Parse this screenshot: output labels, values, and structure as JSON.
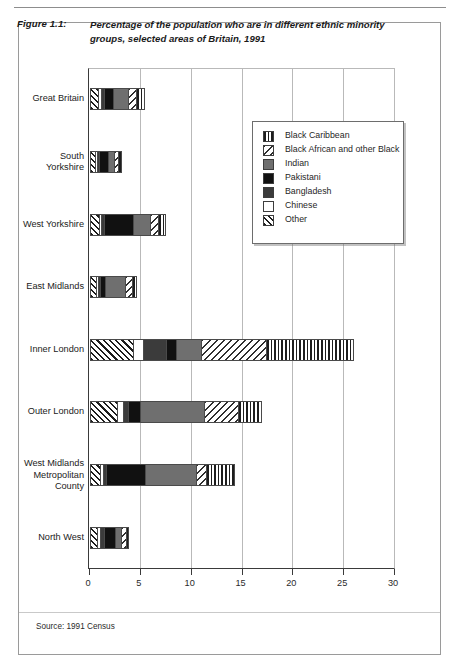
{
  "figure": {
    "label": "Figure 1.1:",
    "title": "Percentage of the population who are in different ethnic minority groups, selected areas of Britain, 1991",
    "source": "Source: 1991 Census"
  },
  "chart_data": {
    "type": "bar",
    "orientation": "horizontal",
    "stacked": true,
    "title": "Percentage of the population who are in different ethnic minority groups, selected areas of Britain, 1991",
    "xlabel": "",
    "ylabel": "",
    "xlim": [
      0,
      30
    ],
    "xticks": [
      0,
      5,
      10,
      15,
      20,
      25,
      30
    ],
    "grid": true,
    "legend_position": "upper-right-inside",
    "categories": [
      "Great Britain",
      "South Yorkshire",
      "West Yorkshire",
      "East Midlands",
      "Inner London",
      "Outer London",
      "West Midlands Metropolitan County",
      "North West"
    ],
    "series": [
      {
        "name": "Other",
        "pattern": "diagonal-hatch",
        "values": [
          0.8,
          0.5,
          0.9,
          0.6,
          4.3,
          2.7,
          1.0,
          0.7
        ]
      },
      {
        "name": "Chinese",
        "pattern": "white",
        "values": [
          0.3,
          0.2,
          0.2,
          0.2,
          1.0,
          0.6,
          0.3,
          0.3
        ]
      },
      {
        "name": "Bangladesh",
        "pattern": "dark-gray",
        "values": [
          0.3,
          0.2,
          0.3,
          0.2,
          2.2,
          0.5,
          0.3,
          0.4
        ]
      },
      {
        "name": "Pakistani",
        "pattern": "black",
        "values": [
          0.9,
          0.9,
          2.9,
          0.5,
          1.0,
          1.2,
          3.9,
          1.1
        ]
      },
      {
        "name": "Indian",
        "pattern": "medium-gray",
        "values": [
          1.5,
          0.6,
          1.6,
          2.0,
          2.5,
          6.3,
          5.0,
          0.6
        ]
      },
      {
        "name": "Black African and other Black",
        "pattern": "dotted",
        "values": [
          0.8,
          0.4,
          0.8,
          0.7,
          6.4,
          3.3,
          1.0,
          0.5
        ]
      },
      {
        "name": "Black Caribbean",
        "pattern": "vertical-stripes",
        "values": [
          0.9,
          0.4,
          0.8,
          0.5,
          8.6,
          2.4,
          2.8,
          0.3
        ]
      }
    ],
    "totals": [
      5.5,
      3.2,
      7.5,
      4.7,
      26.0,
      17.0,
      14.3,
      3.9
    ]
  },
  "legend": {
    "items": [
      {
        "label": "Black Caribbean",
        "pattern": "vertical-stripes"
      },
      {
        "label": "Black African and other Black",
        "pattern": "dotted"
      },
      {
        "label": "Indian",
        "pattern": "medium-gray"
      },
      {
        "label": "Pakistani",
        "pattern": "black"
      },
      {
        "label": "Bangladesh",
        "pattern": "dark-gray"
      },
      {
        "label": "Chinese",
        "pattern": "white"
      },
      {
        "label": "Other",
        "pattern": "diagonal-hatch"
      }
    ]
  }
}
